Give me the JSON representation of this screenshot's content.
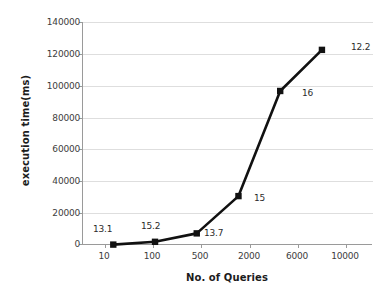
{
  "chart_data": {
    "type": "line",
    "title": "",
    "xlabel": "No. of Queries",
    "ylabel": "execution time(ms)",
    "categories": [
      "10",
      "100",
      "500",
      "2000",
      "6000",
      "10000"
    ],
    "values": [
      250,
      2000,
      7300,
      30700,
      96700,
      122500
    ],
    "point_labels": [
      "13.1",
      "15.2",
      "13.7",
      "15",
      "16",
      "12.2"
    ],
    "ylim": [
      0,
      140000
    ],
    "yticks": [
      "0",
      "20000",
      "40000",
      "60000",
      "80000",
      "100000",
      "120000",
      "140000"
    ],
    "ytick_values": [
      0,
      20000,
      40000,
      60000,
      80000,
      100000,
      120000,
      140000
    ],
    "grid": true,
    "legend": "none",
    "series": [
      {
        "name": "execution time",
        "marker": "square",
        "color": "#111111",
        "values": [
          250,
          2000,
          7300,
          30700,
          96700,
          122500
        ]
      }
    ]
  },
  "colors": {
    "line": "#111111",
    "marker": "#111111",
    "grid": "#dedede",
    "axis": "#9a9a9a",
    "text": "#3d3d3d",
    "title_text": "#1c1c1c",
    "background": "#ffffff"
  },
  "axis": {
    "y_title": "execution time(ms)",
    "x_title": "No. of Queries"
  },
  "ticks": {
    "y": [
      "140000",
      "120000",
      "100000",
      "80000",
      "60000",
      "40000",
      "20000",
      "0"
    ],
    "x": [
      "10",
      "100",
      "500",
      "2000",
      "6000",
      "10000"
    ]
  },
  "labels": {
    "p0": "13.1",
    "p1": "15.2",
    "p2": "13.7",
    "p3": "15",
    "p4": "16",
    "p5": "12.2"
  }
}
